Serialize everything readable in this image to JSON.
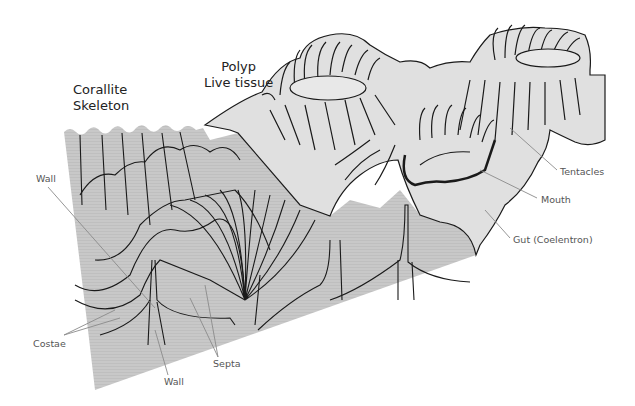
{
  "diagram": {
    "titles": {
      "skeleton": {
        "line1": "Corallite",
        "line2": "Skeleton"
      },
      "polyp": {
        "line1": "Polyp",
        "line2": "Live tissue"
      }
    },
    "labels": {
      "wall_top": "Wall",
      "costae": "Costae",
      "wall_bottom": "Wall",
      "septa": "Septa",
      "tentacles": "Tentacles",
      "mouth": "Mouth",
      "gut": "Gut (Coelentron)"
    },
    "colors": {
      "skeleton_fill": "#c4c4c4",
      "tissue_fill": "#e0e0e0",
      "line": "#1a1a1a",
      "leader": "#8a8a8a",
      "label_text": "#555555"
    }
  }
}
